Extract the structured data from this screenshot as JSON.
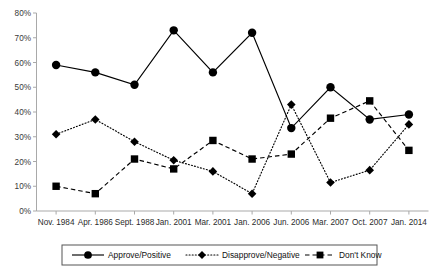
{
  "chart_data": {
    "type": "line",
    "title": "",
    "xlabel": "",
    "ylabel": "",
    "ylim": [
      0,
      80
    ],
    "ytick_labels": [
      "0%",
      "10%",
      "20%",
      "30%",
      "40%",
      "50%",
      "60%",
      "70%",
      "80%"
    ],
    "ytick_values": [
      0,
      10,
      20,
      30,
      40,
      50,
      60,
      70,
      80
    ],
    "grid": false,
    "legend_position": "bottom",
    "categories": [
      "Nov. 1984",
      "Apr. 1986",
      "Sept. 1988",
      "Jan. 2001",
      "Mar. 2001",
      "Jan. 2006",
      "Jun. 2006",
      "Mar. 2007",
      "Oct. 2007",
      "Jan. 2014"
    ],
    "series": [
      {
        "name": "Approve/Positive",
        "marker": "circle",
        "line_style": "solid",
        "color": "#000000",
        "values": [
          59,
          56,
          51,
          73,
          56,
          72,
          33.5,
          50,
          37,
          39
        ]
      },
      {
        "name": "Disapprove/Negative",
        "marker": "diamond",
        "line_style": "dotted",
        "color": "#000000",
        "values": [
          31,
          37,
          28,
          20.5,
          16,
          7,
          43,
          11.5,
          16.5,
          35
        ]
      },
      {
        "name": "Don't Know",
        "marker": "square",
        "line_style": "dashed",
        "color": "#000000",
        "values": [
          10,
          7,
          21,
          17,
          28.5,
          21,
          23,
          37.5,
          44.5,
          24.5
        ]
      }
    ]
  },
  "legend": {
    "items": [
      {
        "label": "Approve/Positive"
      },
      {
        "label": "Disapprove/Negative"
      },
      {
        "label": "Don't Know"
      }
    ]
  }
}
